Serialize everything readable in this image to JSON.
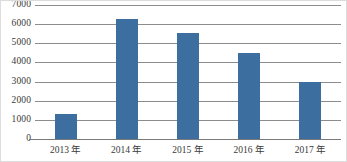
{
  "chart_data": {
    "type": "bar",
    "title": "",
    "xlabel": "",
    "ylabel": "",
    "categories": [
      "2013 年",
      "2014 年",
      "2015 年",
      "2016 年",
      "2017 年"
    ],
    "values": [
      1300,
      6250,
      5550,
      4500,
      3000
    ],
    "ylim": [
      0,
      7000
    ],
    "yticks": [
      0,
      1000,
      2000,
      3000,
      4000,
      5000,
      6000,
      7000
    ],
    "ytick_labels": [
      "0",
      "1000",
      "2000",
      "3000",
      "4000",
      "5000",
      "6000",
      "7000"
    ],
    "grid": true,
    "legend": false,
    "legend_position": "none",
    "bar_color": "#3c6e9f",
    "grid_color": "#8c8c8c",
    "axis_color": "#7a7a7a",
    "border_color": "#dcdcdc"
  }
}
